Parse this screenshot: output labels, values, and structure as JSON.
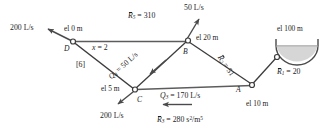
{
  "figure": {
    "type": "pipe-network-diagram",
    "line_color": "#5a5a5a",
    "text_color": "#1d1d1d",
    "reservoir_fill": "#d8d8d8"
  },
  "nodes": [
    {
      "id": "A",
      "label": "A",
      "elevation": "el 10 m"
    },
    {
      "id": "B",
      "label": "B",
      "elevation": "el 20 m"
    },
    {
      "id": "C",
      "label": "C",
      "elevation": "el 5 m"
    },
    {
      "id": "D",
      "label": "D",
      "elevation": "el 0 m"
    }
  ],
  "reservoir": {
    "elevation": "el 100 m"
  },
  "demands": [
    {
      "at": "D",
      "value": "200 L/s",
      "direction": "out-upper-left"
    },
    {
      "at": "B",
      "value": "50 L/s",
      "direction": "out-up"
    },
    {
      "at": "C",
      "value": "200 L/s",
      "direction": "out-lower-left"
    }
  ],
  "pipes": {
    "r5": "R̅₅ = 310",
    "r5_sym": "R",
    "r5_sub": "5",
    "r5_val": " = 310",
    "r2_sym": "R",
    "r2_sub": "2",
    "r2_val": " = 51",
    "r1_sym": "R",
    "r1_sub": "1",
    "r1_val": " = 20",
    "r3_sym": "R",
    "r3_sub": "3",
    "r3_val": " = 280 s",
    "r3_unit_sup1": "2",
    "r3_unit_mid": "/m",
    "r3_unit_sup2": "5",
    "q4_sym": "Q",
    "q4_sub": "4",
    "q4_val": " = 50 L/s",
    "q3_sym": "Q",
    "q3_sub": "3",
    "q3_val": " = 170 L/s",
    "x_label_sym": "x",
    "x_label_val": " = 2",
    "bracket_label": "[6]"
  }
}
